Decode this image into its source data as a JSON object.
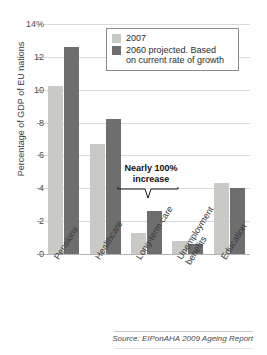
{
  "chart_data": {
    "type": "bar",
    "title": "",
    "xlabel": "",
    "ylabel": "Percentage of GDP of EU nations",
    "ylim": [
      0,
      14
    ],
    "yticks": [
      0,
      2,
      4,
      6,
      8,
      10,
      12,
      14
    ],
    "ytick_labels": [
      "0",
      "2",
      "4",
      "6",
      "8",
      "10",
      "12",
      "14%"
    ],
    "grid": true,
    "legend_position": "top-right",
    "categories": [
      "Pensions",
      "Healthcare",
      "Long-term care",
      "Unemployment benefits",
      "Education"
    ],
    "series": [
      {
        "name": "2007",
        "color": "#c9c9c6",
        "values": [
          10.2,
          6.7,
          1.3,
          0.8,
          4.3
        ]
      },
      {
        "name": "2060 projected. Based on current rate of growth",
        "color": "#6e6e6e",
        "values": [
          12.6,
          8.2,
          2.6,
          0.6,
          4.0
        ]
      }
    ],
    "annotations": [
      {
        "text_line1": "Nearly 100%",
        "text_line2": "increase",
        "target_category": "Long-term care"
      }
    ],
    "source": "Source: EIPonAHA 2009 Ageing Report"
  },
  "legend": {
    "entries": [
      {
        "label": "2007",
        "swatch": "#c9c9c6"
      },
      {
        "label_line1": "2060 projected. Based",
        "label_line2": "on current rate of growth",
        "swatch": "#6e6e6e"
      }
    ]
  },
  "axis": {
    "y_title": "Percentage of GDP of EU nations",
    "y_labels": {
      "t14": "14%",
      "t12": "12",
      "t10": "10",
      "t8": "8",
      "t6": "6",
      "t4": "4",
      "t2": "2",
      "t0": "0"
    }
  },
  "x_labels": {
    "pensions": "Pensions",
    "healthcare": "Healthcare",
    "longtermcare": "Long-term care",
    "unemployment_l1": "Unemployment",
    "unemployment_l2": "benefits",
    "education": "Education"
  },
  "annotation": {
    "line1": "Nearly 100%",
    "line2": "increase"
  },
  "footer": {
    "source": "Source: EIPonAHA 2009 Ageing Report"
  },
  "title_sliver": ""
}
